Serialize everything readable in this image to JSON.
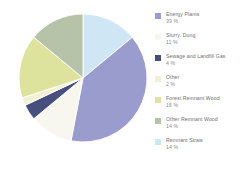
{
  "chart_data": {
    "type": "pie",
    "title": "",
    "subtitle": "",
    "xlabel": "",
    "ylabel": "",
    "legend_position": "right",
    "grid": false,
    "unit": "%",
    "start_angle_deg": 0,
    "direction": "clockwise",
    "categories": [
      "Energy Plants",
      "Slurry, Dung",
      "Sewage and Landfill Gas",
      "Other",
      "Forest Remnant Wood",
      "Other Remnant Wood",
      "Remnant Straw"
    ],
    "values": [
      39,
      11,
      4,
      2,
      16,
      14,
      14
    ],
    "colors": [
      "#9a9ccd",
      "#f7f6ef",
      "#464f7e",
      "#f2f0d5",
      "#dde39d",
      "#b6c3a9",
      "#cfe7f5"
    ],
    "slice_order_clockwise_from_top": [
      "Remnant Straw",
      "Energy Plants",
      "Slurry, Dung",
      "Sewage and Landfill Gas",
      "Other",
      "Forest Remnant Wood",
      "Other Remnant Wood"
    ]
  },
  "legend": {
    "items": [
      {
        "label": "Energy Plants",
        "value": "39 %",
        "color": "#9a9ccd"
      },
      {
        "label": "Slurry, Dung",
        "value": "11 %",
        "color": "#f7f6ef"
      },
      {
        "label": "Sewage and Landfill Gas",
        "value": "4 %",
        "color": "#464f7e"
      },
      {
        "label": "Other",
        "value": "2 %",
        "color": "#f2f0d5"
      },
      {
        "label": "Forest Remnant Wood",
        "value": "16 %",
        "color": "#dde39d"
      },
      {
        "label": "Other Remnant Wood",
        "value": "14 %",
        "color": "#b6c3a9"
      },
      {
        "label": "Remnant Straw",
        "value": "14 %",
        "color": "#cfe7f5"
      }
    ]
  }
}
